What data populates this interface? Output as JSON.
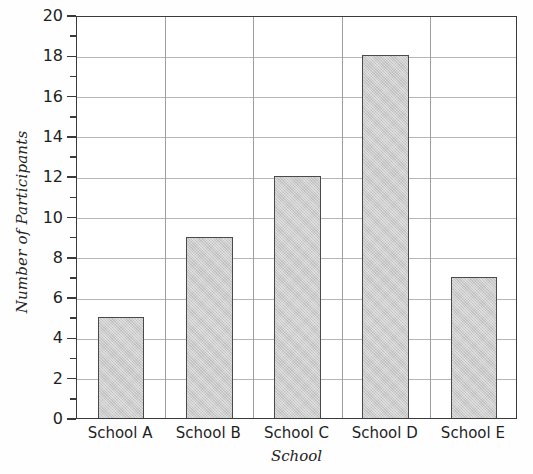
{
  "chart_data": {
    "type": "bar",
    "title": "",
    "subtitle": "",
    "xlabel": "School",
    "ylabel": "Number of Participants",
    "categories": [
      "School A",
      "School B",
      "School C",
      "School D",
      "School E"
    ],
    "values": [
      5,
      9,
      12,
      18,
      7
    ],
    "ylim": [
      0,
      20
    ],
    "y_major_ticks": [
      0,
      2,
      4,
      6,
      8,
      10,
      12,
      14,
      16,
      18,
      20
    ],
    "y_minor_ticks": [
      1,
      3,
      5,
      7,
      9,
      11,
      13,
      15,
      17,
      19
    ],
    "y_tick_labels": [
      "0",
      "2",
      "4",
      "6",
      "8",
      "10",
      "12",
      "14",
      "16",
      "18",
      "20"
    ],
    "grid": {
      "horizontal": true,
      "vertical": true,
      "color": "#b6b6b6"
    },
    "legend": {
      "visible": false,
      "position": "none",
      "entries": []
    },
    "annotations": [],
    "style": {
      "bar_fill": "#c9c9c9",
      "bar_border": "#4a4a4a",
      "frame_color": "#3a3a3a",
      "background": "#ffffff",
      "text_color": "#1f1f1f"
    }
  }
}
